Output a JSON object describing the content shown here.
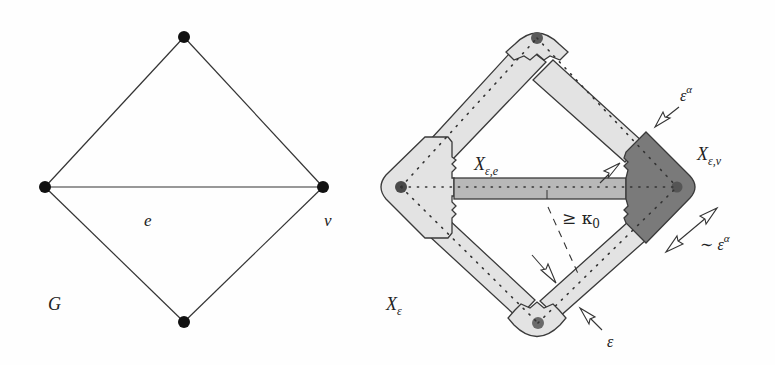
{
  "graph_g": {
    "label": "G",
    "edge_label": "e",
    "vertex_label": "v",
    "vertices": [
      {
        "id": "top",
        "x": 184,
        "y": 37
      },
      {
        "id": "left",
        "x": 45,
        "y": 187
      },
      {
        "id": "right",
        "x": 323,
        "y": 187
      },
      {
        "id": "bottom",
        "x": 184,
        "y": 322
      }
    ],
    "edges": [
      [
        "left",
        "top"
      ],
      [
        "top",
        "right"
      ],
      [
        "left",
        "right"
      ],
      [
        "left",
        "bottom"
      ],
      [
        "bottom",
        "right"
      ]
    ]
  },
  "thickened_graph": {
    "label": "X",
    "label_sub": "ε",
    "edge_region_label": "X",
    "edge_region_sub": "ε,e",
    "vertex_region_label": "X",
    "vertex_region_sub": "ε,v",
    "angle_label": "≥ κ",
    "angle_sub": "0",
    "vertex_size_label": "ε",
    "vertex_size_sup": "α",
    "vertex_width_label": "∼ ε",
    "vertex_width_sup": "α",
    "edge_width_label": "ε",
    "colors": {
      "light_fill": "#e3e3e3",
      "mid_fill": "#b5b5b5",
      "dark_fill": "#7a7a7a",
      "stroke": "#3a3a3a",
      "node_fill": "#5a5a5a"
    }
  }
}
